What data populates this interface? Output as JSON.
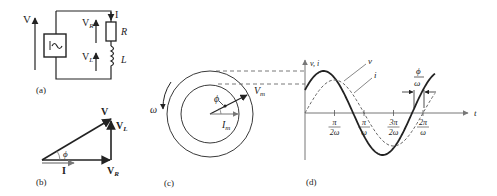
{
  "panels": {
    "a": {
      "caption": "(a)",
      "source_voltage": "V",
      "current": "I",
      "resistor_voltage_base": "V",
      "resistor_voltage_sub": "R",
      "inductor_voltage_base": "V",
      "inductor_voltage_sub": "L",
      "resistor": "R",
      "inductor": "L",
      "source_symbol": "|~"
    },
    "b": {
      "caption": "(b)",
      "phasor_v": "V",
      "phasor_vl_base": "V",
      "phasor_vl_sub": "L",
      "phasor_vr_base": "V",
      "phasor_vr_sub": "R",
      "phasor_i": "I",
      "angle": "ϕ"
    },
    "c": {
      "caption": "(c)",
      "omega": "ω",
      "angle": "ϕ",
      "vm_base": "V",
      "vm_sub": "m",
      "im_base": "I",
      "im_sub": "m"
    },
    "d": {
      "caption": "(d)",
      "y_axis_label": "v, i",
      "x_axis_label": "t",
      "curve_v_label": "v",
      "curve_i_label": "i",
      "phase_shift_num": "ϕ",
      "phase_shift_den": "ω",
      "ticks": [
        {
          "num": "π",
          "den": "2ω"
        },
        {
          "num": "π",
          "den": "ω"
        },
        {
          "num": "3π",
          "den": "2ω"
        },
        {
          "num": "2π",
          "den": "ω"
        }
      ]
    }
  },
  "colors": {
    "stroke": "#222222",
    "gray": "#888888",
    "dashed": "#555555"
  }
}
